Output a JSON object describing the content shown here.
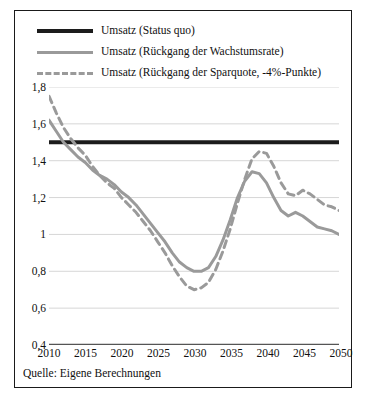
{
  "figure": {
    "source_note": "Quelle: Eigene Berechnungen",
    "border_color": "#1a1a1a"
  },
  "legend": {
    "items": [
      {
        "label": "Umsatz (Status quo)",
        "style": "solid",
        "color": "#1c1c1c",
        "width": 4
      },
      {
        "label": "Umsatz (Rückgang der Wachstumsrate)",
        "style": "solid",
        "color": "#9a9a9a",
        "width": 3
      },
      {
        "label": "Umsatz (Rückgang der Sparquote, -4%-Punkte)",
        "style": "dashed",
        "color": "#9a9a9a",
        "width": 3
      }
    ]
  },
  "chart_data": {
    "type": "line",
    "title": "",
    "xlabel": "",
    "ylabel": "",
    "xlim": [
      2010,
      2050
    ],
    "ylim": [
      0.4,
      1.8
    ],
    "grid": true,
    "legend_position": "top",
    "xticks": [
      2010,
      2015,
      2020,
      2025,
      2030,
      2035,
      2040,
      2045,
      2050
    ],
    "yticks": [
      0.4,
      0.6,
      0.8,
      1.0,
      1.2,
      1.4,
      1.6,
      1.8
    ],
    "ytick_labels": [
      "0,4",
      "0,6",
      "0,8",
      "1",
      "1,2",
      "1,4",
      "1,6",
      "1,8"
    ],
    "xtick_labels": [
      "2010",
      "2015",
      "2020",
      "2025",
      "2030",
      "2035",
      "2040",
      "2045",
      "2050"
    ],
    "x": [
      2010,
      2011,
      2012,
      2013,
      2014,
      2015,
      2016,
      2017,
      2018,
      2019,
      2020,
      2021,
      2022,
      2023,
      2024,
      2025,
      2026,
      2027,
      2028,
      2029,
      2030,
      2031,
      2032,
      2033,
      2034,
      2035,
      2036,
      2037,
      2038,
      2039,
      2040,
      2041,
      2042,
      2043,
      2044,
      2045,
      2046,
      2047,
      2048,
      2049,
      2050
    ],
    "series": [
      {
        "name": "Umsatz (Status quo)",
        "style": "solid",
        "color": "#1c1c1c",
        "width": 4,
        "values": [
          1.5,
          1.5,
          1.5,
          1.5,
          1.5,
          1.5,
          1.5,
          1.5,
          1.5,
          1.5,
          1.5,
          1.5,
          1.5,
          1.5,
          1.5,
          1.5,
          1.5,
          1.5,
          1.5,
          1.5,
          1.5,
          1.5,
          1.5,
          1.5,
          1.5,
          1.5,
          1.5,
          1.5,
          1.5,
          1.5,
          1.5,
          1.5,
          1.5,
          1.5,
          1.5,
          1.5,
          1.5,
          1.5,
          1.5,
          1.5,
          1.5
        ]
      },
      {
        "name": "Umsatz (Rückgang der Wachstumsrate)",
        "style": "solid",
        "color": "#9a9a9a",
        "width": 3,
        "values": [
          1.62,
          1.56,
          1.5,
          1.46,
          1.42,
          1.39,
          1.35,
          1.32,
          1.3,
          1.27,
          1.23,
          1.2,
          1.16,
          1.11,
          1.06,
          1.01,
          0.96,
          0.9,
          0.85,
          0.82,
          0.8,
          0.8,
          0.82,
          0.88,
          0.97,
          1.08,
          1.2,
          1.29,
          1.34,
          1.33,
          1.28,
          1.2,
          1.13,
          1.1,
          1.12,
          1.1,
          1.07,
          1.04,
          1.03,
          1.02,
          1.0
        ]
      },
      {
        "name": "Umsatz (Rückgang der Sparquote, -4%-Punkte)",
        "style": "dashed",
        "color": "#9a9a9a",
        "width": 3,
        "values": [
          1.75,
          1.66,
          1.58,
          1.52,
          1.47,
          1.43,
          1.37,
          1.32,
          1.28,
          1.25,
          1.2,
          1.16,
          1.12,
          1.07,
          1.02,
          0.96,
          0.9,
          0.83,
          0.77,
          0.72,
          0.7,
          0.71,
          0.74,
          0.81,
          0.91,
          1.03,
          1.17,
          1.3,
          1.41,
          1.45,
          1.44,
          1.37,
          1.28,
          1.22,
          1.21,
          1.24,
          1.22,
          1.19,
          1.16,
          1.15,
          1.13
        ]
      }
    ]
  }
}
